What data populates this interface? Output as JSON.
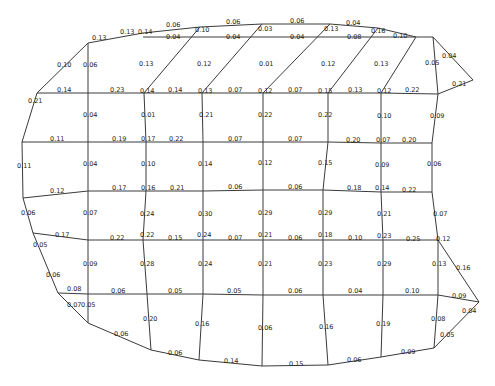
{
  "diagram": {
    "type": "mesh-network",
    "line_color": "#3a3a3a",
    "text_color": "#222222",
    "nodes": {
      "t1": [
        88,
        43
      ],
      "t2": [
        143,
        33
      ],
      "t3": [
        200,
        27
      ],
      "t4": [
        262,
        24
      ],
      "t5": [
        330,
        24
      ],
      "t6": [
        378,
        28
      ],
      "t7": [
        416,
        37
      ],
      "tr1": [
        433,
        37
      ],
      "tr2": [
        473,
        80
      ],
      "a0": [
        37,
        93
      ],
      "a1": [
        88,
        93
      ],
      "a2": [
        144,
        93
      ],
      "a3": [
        202,
        93
      ],
      "a4": [
        263,
        93
      ],
      "a5": [
        328,
        93
      ],
      "a6": [
        381,
        93
      ],
      "a7": [
        438,
        94
      ],
      "b0": [
        22,
        142
      ],
      "b1": [
        88,
        142
      ],
      "b2": [
        146,
        142
      ],
      "b3": [
        203,
        142
      ],
      "b4": [
        263,
        142
      ],
      "b5": [
        328,
        142
      ],
      "b6": [
        381,
        143
      ],
      "b7": [
        432,
        143
      ],
      "c0": [
        23,
        198
      ],
      "c1": [
        88,
        191
      ],
      "c2": [
        146,
        191
      ],
      "c3": [
        203,
        191
      ],
      "c4": [
        263,
        190
      ],
      "c5": [
        323,
        190
      ],
      "c6": [
        381,
        192
      ],
      "c7": [
        432,
        192
      ],
      "d0": [
        33,
        233
      ],
      "d1": [
        88,
        240
      ],
      "d2": [
        143,
        240
      ],
      "d3": [
        203,
        240
      ],
      "d4": [
        263,
        240
      ],
      "d5": [
        323,
        240
      ],
      "d6": [
        383,
        240
      ],
      "d7": [
        438,
        240
      ],
      "e0": [
        58,
        293
      ],
      "e1": [
        88,
        294
      ],
      "e2": [
        147,
        294
      ],
      "e3": [
        203,
        294
      ],
      "e4": [
        263,
        295
      ],
      "e5": [
        323,
        295
      ],
      "e6": [
        383,
        295
      ],
      "e7": [
        438,
        295
      ],
      "rw": [
        479,
        302
      ],
      "f1": [
        88,
        323
      ],
      "f2": [
        151,
        350
      ],
      "f3": [
        199,
        360
      ],
      "f4": [
        262,
        366
      ],
      "f5": [
        328,
        365
      ],
      "f6": [
        381,
        357
      ],
      "f7": [
        434,
        348
      ]
    },
    "edges": [
      [
        "t1",
        "t2"
      ],
      [
        "t2",
        "t3"
      ],
      [
        "t3",
        "t4"
      ],
      [
        "t4",
        "t5"
      ],
      [
        "t5",
        "t6"
      ],
      [
        "t6",
        "t7"
      ],
      [
        "t7",
        "tr1"
      ],
      [
        "tr1",
        "tr2"
      ],
      [
        "tr2",
        "a7"
      ],
      [
        "tr1",
        "a7"
      ],
      [
        "a0",
        "t1"
      ],
      [
        "a0",
        "a1"
      ],
      [
        "a1",
        "a2"
      ],
      [
        "a2",
        "a3"
      ],
      [
        "a3",
        "a4"
      ],
      [
        "a4",
        "a5"
      ],
      [
        "a5",
        "a6"
      ],
      [
        "a6",
        "a7"
      ],
      [
        "a0",
        "b0"
      ],
      [
        "b0",
        "b1"
      ],
      [
        "b1",
        "b2"
      ],
      [
        "b2",
        "b3"
      ],
      [
        "b3",
        "b4"
      ],
      [
        "b4",
        "b5"
      ],
      [
        "b5",
        "b6"
      ],
      [
        "b6",
        "b7"
      ],
      [
        "b0",
        "c0"
      ],
      [
        "a7",
        "b7"
      ],
      [
        "c0",
        "c1"
      ],
      [
        "c1",
        "c2"
      ],
      [
        "c2",
        "c3"
      ],
      [
        "c3",
        "c4"
      ],
      [
        "c4",
        "c5"
      ],
      [
        "c5",
        "c6"
      ],
      [
        "c6",
        "c7"
      ],
      [
        "c0",
        "d0"
      ],
      [
        "b7",
        "c7"
      ],
      [
        "d0",
        "d1"
      ],
      [
        "d1",
        "d2"
      ],
      [
        "d2",
        "d3"
      ],
      [
        "d3",
        "d4"
      ],
      [
        "d4",
        "d5"
      ],
      [
        "d5",
        "d6"
      ],
      [
        "d6",
        "d7"
      ],
      [
        "c7",
        "d7"
      ],
      [
        "d7",
        "rw"
      ],
      [
        "d0",
        "e0"
      ],
      [
        "e0",
        "e1"
      ],
      [
        "e1",
        "e2"
      ],
      [
        "e2",
        "e3"
      ],
      [
        "e3",
        "e4"
      ],
      [
        "e4",
        "e5"
      ],
      [
        "e5",
        "e6"
      ],
      [
        "e6",
        "e7"
      ],
      [
        "e7",
        "rw"
      ],
      [
        "e0",
        "f1"
      ],
      [
        "f1",
        "f2"
      ],
      [
        "f2",
        "f3"
      ],
      [
        "f3",
        "f4"
      ],
      [
        "f4",
        "f5"
      ],
      [
        "f5",
        "f6"
      ],
      [
        "f6",
        "f7"
      ],
      [
        "f7",
        "rw"
      ],
      [
        "t1",
        "a1"
      ],
      [
        "a1",
        "b1"
      ],
      [
        "b1",
        "c1"
      ],
      [
        "c1",
        "d1"
      ],
      [
        "d1",
        "e1"
      ],
      [
        "e1",
        "f1"
      ],
      [
        "t3",
        "a2"
      ],
      [
        "a2",
        "b2"
      ],
      [
        "b2",
        "c2"
      ],
      [
        "c2",
        "d2"
      ],
      [
        "d2",
        "e2"
      ],
      [
        "e2",
        "f2"
      ],
      [
        "t4",
        "a3"
      ],
      [
        "a3",
        "b3"
      ],
      [
        "b3",
        "c3"
      ],
      [
        "c3",
        "d3"
      ],
      [
        "d3",
        "e3"
      ],
      [
        "e3",
        "f3"
      ],
      [
        "t5",
        "a4"
      ],
      [
        "a4",
        "b4"
      ],
      [
        "b4",
        "c4"
      ],
      [
        "c4",
        "d4"
      ],
      [
        "d4",
        "e4"
      ],
      [
        "e4",
        "f4"
      ],
      [
        "t6",
        "a5"
      ],
      [
        "a5",
        "b5"
      ],
      [
        "b5",
        "c5"
      ],
      [
        "c5",
        "d5"
      ],
      [
        "d5",
        "e5"
      ],
      [
        "e5",
        "f5"
      ],
      [
        "t7",
        "a6"
      ],
      [
        "a6",
        "b6"
      ],
      [
        "b6",
        "c6"
      ],
      [
        "c6",
        "d6"
      ],
      [
        "d6",
        "e6"
      ],
      [
        "e6",
        "f6"
      ],
      [
        "e7",
        "f7"
      ],
      [
        "d7",
        "e7"
      ]
    ],
    "inner_top_edge": [
      [
        143,
        37
      ],
      [
        416,
        37
      ]
    ],
    "labels": [
      {
        "text": "0.13",
        "x": 92,
        "y": 40
      },
      {
        "text": "0.13",
        "x": 120,
        "y": 34
      },
      {
        "text": "0.14",
        "x": 138,
        "y": 34
      },
      {
        "text": "0.06",
        "x": 166,
        "y": 27
      },
      {
        "text": "0.10",
        "x": 195,
        "y": 32
      },
      {
        "text": "0.06",
        "x": 226,
        "y": 24
      },
      {
        "text": "0.03",
        "x": 258,
        "y": 31
      },
      {
        "text": "0.06",
        "x": 290,
        "y": 23
      },
      {
        "text": "0.13",
        "x": 324,
        "y": 31
      },
      {
        "text": "0.04",
        "x": 346,
        "y": 25
      },
      {
        "text": "0.16",
        "x": 371,
        "y": 33
      },
      {
        "text": "0.04",
        "x": 166,
        "y": 39
      },
      {
        "text": "0.04",
        "x": 226,
        "y": 39
      },
      {
        "text": "0.04",
        "x": 290,
        "y": 39
      },
      {
        "text": "0.08",
        "x": 347,
        "y": 39
      },
      {
        "text": "0.10",
        "x": 393,
        "y": 38
      },
      {
        "text": "0.04",
        "x": 442,
        "y": 58
      },
      {
        "text": "0.05",
        "x": 425,
        "y": 65
      },
      {
        "text": "0.21",
        "x": 452,
        "y": 86
      },
      {
        "text": "0.10",
        "x": 57,
        "y": 67
      },
      {
        "text": "0.06",
        "x": 83,
        "y": 67
      },
      {
        "text": "0.13",
        "x": 139,
        "y": 66
      },
      {
        "text": "0.12",
        "x": 197,
        "y": 66
      },
      {
        "text": "0.01",
        "x": 259,
        "y": 66
      },
      {
        "text": "0.12",
        "x": 321,
        "y": 66
      },
      {
        "text": "0.13",
        "x": 374,
        "y": 66
      },
      {
        "text": "0.21",
        "x": 28,
        "y": 103
      },
      {
        "text": "0.14",
        "x": 57,
        "y": 92
      },
      {
        "text": "0.23",
        "x": 110,
        "y": 92
      },
      {
        "text": "0.14",
        "x": 140,
        "y": 93
      },
      {
        "text": "0.14",
        "x": 168,
        "y": 92
      },
      {
        "text": "0.13",
        "x": 198,
        "y": 93
      },
      {
        "text": "0.07",
        "x": 228,
        "y": 92
      },
      {
        "text": "0.12",
        "x": 258,
        "y": 93
      },
      {
        "text": "0.07",
        "x": 288,
        "y": 92
      },
      {
        "text": "0.15",
        "x": 318,
        "y": 93
      },
      {
        "text": "0.13",
        "x": 348,
        "y": 92
      },
      {
        "text": "0.12",
        "x": 377,
        "y": 93
      },
      {
        "text": "0.22",
        "x": 405,
        "y": 92
      },
      {
        "text": "0.04",
        "x": 83,
        "y": 117
      },
      {
        "text": "0.01",
        "x": 141,
        "y": 117
      },
      {
        "text": "0.21",
        "x": 199,
        "y": 117
      },
      {
        "text": "0.22",
        "x": 258,
        "y": 117
      },
      {
        "text": "0.22",
        "x": 318,
        "y": 117
      },
      {
        "text": "0.10",
        "x": 377,
        "y": 118
      },
      {
        "text": "0.09",
        "x": 430,
        "y": 118
      },
      {
        "text": "0.11",
        "x": 50,
        "y": 141
      },
      {
        "text": "0.19",
        "x": 112,
        "y": 141
      },
      {
        "text": "0.17",
        "x": 141,
        "y": 141
      },
      {
        "text": "0.22",
        "x": 169,
        "y": 141
      },
      {
        "text": "0.07",
        "x": 228,
        "y": 141
      },
      {
        "text": "0.07",
        "x": 288,
        "y": 141
      },
      {
        "text": "0.20",
        "x": 346,
        "y": 142
      },
      {
        "text": "0.07",
        "x": 376,
        "y": 142
      },
      {
        "text": "0.20",
        "x": 402,
        "y": 142
      },
      {
        "text": "0.11",
        "x": 17,
        "y": 168
      },
      {
        "text": "0.04",
        "x": 83,
        "y": 166
      },
      {
        "text": "0.10",
        "x": 141,
        "y": 166
      },
      {
        "text": "0.14",
        "x": 198,
        "y": 166
      },
      {
        "text": "0.12",
        "x": 258,
        "y": 165
      },
      {
        "text": "0.15",
        "x": 318,
        "y": 165
      },
      {
        "text": "0.09",
        "x": 375,
        "y": 167
      },
      {
        "text": "0.06",
        "x": 427,
        "y": 166
      },
      {
        "text": "0.12",
        "x": 50,
        "y": 193
      },
      {
        "text": "0.17",
        "x": 112,
        "y": 190
      },
      {
        "text": "0.16",
        "x": 141,
        "y": 190
      },
      {
        "text": "0.21",
        "x": 170,
        "y": 190
      },
      {
        "text": "0.06",
        "x": 228,
        "y": 189
      },
      {
        "text": "0.06",
        "x": 288,
        "y": 189
      },
      {
        "text": "0.18",
        "x": 347,
        "y": 190
      },
      {
        "text": "0.14",
        "x": 375,
        "y": 190
      },
      {
        "text": "0.22",
        "x": 402,
        "y": 192
      },
      {
        "text": "0.06",
        "x": 21,
        "y": 215
      },
      {
        "text": "0.07",
        "x": 83,
        "y": 215
      },
      {
        "text": "0.24",
        "x": 140,
        "y": 216
      },
      {
        "text": "0.30",
        "x": 198,
        "y": 216
      },
      {
        "text": "0.29",
        "x": 258,
        "y": 215
      },
      {
        "text": "0.29",
        "x": 318,
        "y": 215
      },
      {
        "text": "0.21",
        "x": 377,
        "y": 216
      },
      {
        "text": "0.07",
        "x": 433,
        "y": 216
      },
      {
        "text": "0.17",
        "x": 55,
        "y": 237
      },
      {
        "text": "0.22",
        "x": 110,
        "y": 240
      },
      {
        "text": "0.22",
        "x": 140,
        "y": 237
      },
      {
        "text": "0.15",
        "x": 168,
        "y": 240
      },
      {
        "text": "0.24",
        "x": 197,
        "y": 237
      },
      {
        "text": "0.07",
        "x": 228,
        "y": 240
      },
      {
        "text": "0.21",
        "x": 258,
        "y": 237
      },
      {
        "text": "0.06",
        "x": 288,
        "y": 240
      },
      {
        "text": "0.18",
        "x": 318,
        "y": 237
      },
      {
        "text": "0.10",
        "x": 348,
        "y": 240
      },
      {
        "text": "0.23",
        "x": 377,
        "y": 238
      },
      {
        "text": "0.25",
        "x": 406,
        "y": 241
      },
      {
        "text": "0.12",
        "x": 436,
        "y": 241
      },
      {
        "text": "0.05",
        "x": 33,
        "y": 247
      },
      {
        "text": "0.09",
        "x": 83,
        "y": 266
      },
      {
        "text": "0.28",
        "x": 140,
        "y": 266
      },
      {
        "text": "0.24",
        "x": 198,
        "y": 266
      },
      {
        "text": "0.21",
        "x": 258,
        "y": 266
      },
      {
        "text": "0.23",
        "x": 318,
        "y": 266
      },
      {
        "text": "0.29",
        "x": 377,
        "y": 266
      },
      {
        "text": "0.13",
        "x": 432,
        "y": 266
      },
      {
        "text": "0.16",
        "x": 456,
        "y": 270
      },
      {
        "text": "0.06",
        "x": 46,
        "y": 277
      },
      {
        "text": "0.08",
        "x": 67,
        "y": 291
      },
      {
        "text": "0.06",
        "x": 111,
        "y": 293
      },
      {
        "text": "0.05",
        "x": 168,
        "y": 293
      },
      {
        "text": "0.05",
        "x": 227,
        "y": 293
      },
      {
        "text": "0.06",
        "x": 288,
        "y": 293
      },
      {
        "text": "0.04",
        "x": 348,
        "y": 293
      },
      {
        "text": "0.10",
        "x": 405,
        "y": 293
      },
      {
        "text": "0.09",
        "x": 452,
        "y": 298
      },
      {
        "text": "0.07",
        "x": 67,
        "y": 307
      },
      {
        "text": "0.05",
        "x": 81,
        "y": 307
      },
      {
        "text": "0.20",
        "x": 143,
        "y": 321
      },
      {
        "text": "0.16",
        "x": 195,
        "y": 326
      },
      {
        "text": "0.06",
        "x": 258,
        "y": 330
      },
      {
        "text": "0.16",
        "x": 319,
        "y": 329
      },
      {
        "text": "0.19",
        "x": 376,
        "y": 326
      },
      {
        "text": "0.08",
        "x": 431,
        "y": 321
      },
      {
        "text": "0.04",
        "x": 462,
        "y": 313
      },
      {
        "text": "0.05",
        "x": 440,
        "y": 337
      },
      {
        "text": "0.06",
        "x": 114,
        "y": 336
      },
      {
        "text": "0.06",
        "x": 168,
        "y": 355
      },
      {
        "text": "0.14",
        "x": 224,
        "y": 363
      },
      {
        "text": "0.15",
        "x": 289,
        "y": 366
      },
      {
        "text": "0.06",
        "x": 347,
        "y": 362
      },
      {
        "text": "0.09",
        "x": 401,
        "y": 354
      }
    ]
  }
}
